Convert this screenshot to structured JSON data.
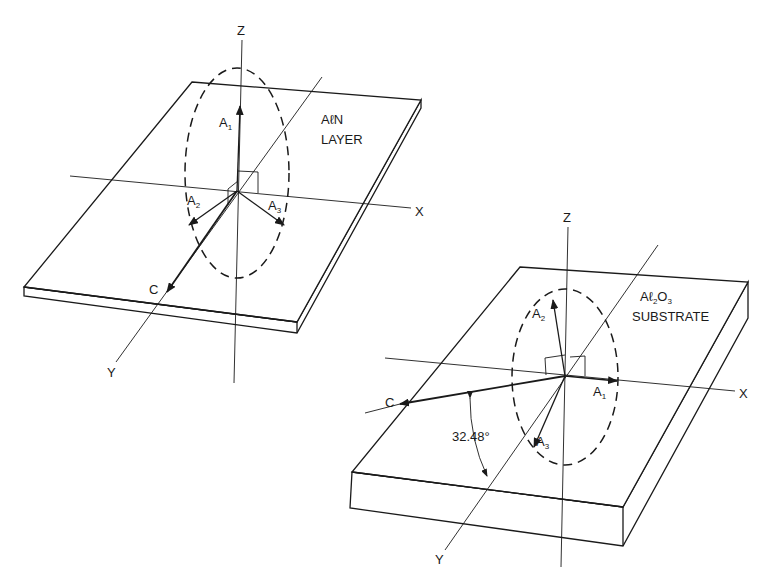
{
  "figure": {
    "top_diagram": {
      "title_line1": "AℓN",
      "title_line2": "LAYER",
      "axes": {
        "z": "Z",
        "x": "X",
        "y": "Y"
      },
      "vectors": {
        "a1": "A",
        "a1_sub": "1",
        "a2": "A",
        "a2_sub": "2",
        "a3": "A",
        "a3_sub": "3",
        "c": "C"
      }
    },
    "bottom_diagram": {
      "title_line1_a": "Aℓ",
      "title_line1_sub1": "2",
      "title_line1_b": "O",
      "title_line1_sub2": "3",
      "title_line2": "SUBSTRATE",
      "axes": {
        "z": "Z",
        "x": "X",
        "y": "Y"
      },
      "vectors": {
        "a1": "A",
        "a1_sub": "1",
        "a2": "A",
        "a2_sub": "2",
        "a3": "A",
        "a3_sub": "3",
        "c": "C"
      },
      "angle_label": "32.48°"
    },
    "colors": {
      "ink": "#1a1a1a",
      "background": "#ffffff"
    }
  }
}
